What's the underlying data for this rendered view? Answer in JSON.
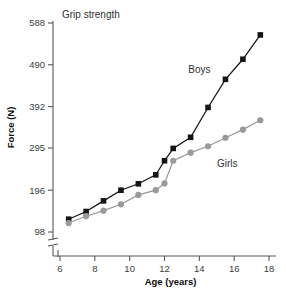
{
  "chart_data": {
    "type": "line",
    "title": "Grip strength",
    "xlabel": "Age (years)",
    "ylabel": "Force (N)",
    "xlim": [
      5.6,
      18.4
    ],
    "ylim": [
      98,
      588
    ],
    "grid": false,
    "legend_position": "inline-annotation",
    "x_ticks": [
      6,
      8,
      10,
      12,
      14,
      16,
      18
    ],
    "y_ticks": [
      98,
      196,
      295,
      392,
      490,
      588
    ],
    "axis_break": true,
    "x": [
      6.5,
      7.5,
      8.5,
      9.5,
      10.5,
      11.5,
      12.0,
      12.5,
      13.5,
      14.5,
      15.5,
      16.5,
      17.5
    ],
    "series": [
      {
        "name": "Boys",
        "color": "#151515",
        "marker": "square",
        "label_x": 14.0,
        "label_y": 470,
        "values": [
          128,
          146,
          171,
          196,
          211,
          232,
          265,
          294,
          320,
          390,
          456,
          503,
          560
        ]
      },
      {
        "name": "Girls",
        "color": "#9a9a9a",
        "marker": "circle",
        "label_x": 15.6,
        "label_y": 250,
        "values": [
          119,
          135,
          148,
          163,
          185,
          196,
          212,
          265,
          284,
          299,
          319,
          338,
          360
        ]
      }
    ]
  }
}
